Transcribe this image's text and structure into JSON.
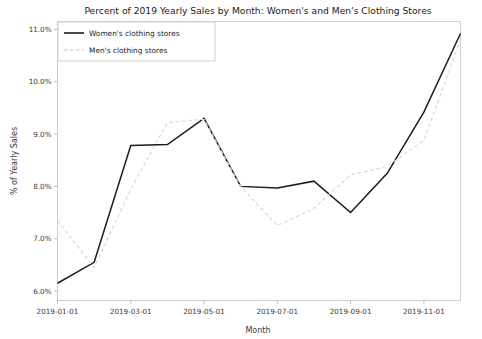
{
  "chart_data": {
    "type": "line",
    "title": "Percent of 2019 Yearly Sales by Month: Women's and Men's Clothing Stores",
    "xlabel": "Month",
    "ylabel": "% of Yearly Sales",
    "x": [
      "2019-01-01",
      "2019-02-01",
      "2019-03-01",
      "2019-04-01",
      "2019-05-01",
      "2019-06-01",
      "2019-07-01",
      "2019-08-01",
      "2019-09-01",
      "2019-10-01",
      "2019-11-01",
      "2019-12-01"
    ],
    "xticklabels": [
      "2019-01-01",
      "2019-03-01",
      "2019-05-01",
      "2019-07-01",
      "2019-09-01",
      "2019-11-01"
    ],
    "xtickvalues": [
      "2019-01-01",
      "2019-03-01",
      "2019-05-01",
      "2019-07-01",
      "2019-09-01",
      "2019-11-01"
    ],
    "yticklabels": [
      "6.0%",
      "7.0%",
      "8.0%",
      "9.0%",
      "10.0%",
      "11.0%"
    ],
    "ytickvalues": [
      6.0,
      7.0,
      8.0,
      9.0,
      10.0,
      11.0
    ],
    "ylim": [
      5.82,
      11.15
    ],
    "grid": false,
    "legend_position": "upper left",
    "series": [
      {
        "name": "Women's clothing stores",
        "color": "#1c1c1c",
        "linestyle": "solid",
        "linewidth": 1.5,
        "values": [
          6.15,
          6.55,
          8.78,
          8.8,
          9.3,
          8.0,
          7.97,
          8.1,
          7.5,
          8.25,
          9.42,
          10.92
        ]
      },
      {
        "name": "Men's clothing stores",
        "color": "#d8d8d8",
        "linestyle": "dashed",
        "linewidth": 1.2,
        "values": [
          7.35,
          6.45,
          7.95,
          9.22,
          9.28,
          8.0,
          7.25,
          7.58,
          8.22,
          8.38,
          8.88,
          10.8
        ]
      }
    ]
  },
  "legend": {
    "items": [
      {
        "label": "Women's clothing stores",
        "swatch": "solid-line-swatch"
      },
      {
        "label": "Men's clothing stores",
        "swatch": "dashed-line-swatch"
      }
    ]
  },
  "figure": {
    "background": "#ffffff",
    "axes_background": "#ffffff",
    "spine_color": "#cfcfcf"
  }
}
